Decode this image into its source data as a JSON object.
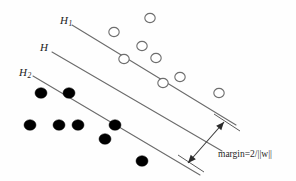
{
  "figure": {
    "background_color": "#fefefe",
    "width": 296,
    "height": 181
  },
  "labels": {
    "h1": {
      "base": "H",
      "subscript": "1",
      "x": 60,
      "y": 21
    },
    "h": {
      "base": "H",
      "subscript": "",
      "x": 40,
      "y": 48
    },
    "h2": {
      "base": "H",
      "subscript": "2",
      "x": 19,
      "y": 73
    }
  },
  "margin_annotation": {
    "caption": "margin=2/||w||",
    "caption_x": 218,
    "caption_y": 155,
    "color": "#1f1f1f"
  },
  "lines": {
    "stroke_color": "#6b6b6b",
    "stroke_width": 1.1,
    "items": [
      {
        "name": "H1",
        "x1": 72,
        "y1": 25,
        "x2": 236,
        "y2": 125
      },
      {
        "name": "H",
        "x1": 52,
        "y1": 52,
        "x2": 222,
        "y2": 151
      },
      {
        "name": "H2",
        "x1": 33,
        "y1": 76,
        "x2": 200,
        "y2": 175
      }
    ]
  },
  "margin_arrow": {
    "x1": 224,
    "y1": 122,
    "x2": 188,
    "y2": 163,
    "color": "#3a3a3a",
    "double_headed": true
  },
  "ticks": [
    {
      "name": "tick-upper",
      "x1": 214,
      "y1": 114,
      "x2": 240,
      "y2": 131
    },
    {
      "name": "tick-lower",
      "x1": 178,
      "y1": 155,
      "x2": 204,
      "y2": 172
    }
  ],
  "chart_data": {
    "type": "scatter",
    "xlabel": "",
    "ylabel": "",
    "grid": false,
    "legend": "none",
    "annotations": [
      "H",
      "H1",
      "H2",
      "margin=2/||w||"
    ],
    "series": [
      {
        "name": "class-positive-open-circles",
        "marker": "open-circle",
        "fill": "#ffffff",
        "stroke": "#6e6e6e",
        "radius": 5.2,
        "points": [
          {
            "x": 150,
            "y": 18
          },
          {
            "x": 114,
            "y": 32
          },
          {
            "x": 142,
            "y": 46
          },
          {
            "x": 124,
            "y": 59
          },
          {
            "x": 156,
            "y": 58
          },
          {
            "x": 180,
            "y": 77
          },
          {
            "x": 163,
            "y": 83
          },
          {
            "x": 219,
            "y": 93
          }
        ]
      },
      {
        "name": "class-negative-filled-dots",
        "marker": "filled-circle",
        "fill": "#000000",
        "stroke": "#000000",
        "radius": 6.0,
        "points": [
          {
            "x": 41,
            "y": 93
          },
          {
            "x": 69,
            "y": 93
          },
          {
            "x": 30,
            "y": 125
          },
          {
            "x": 59,
            "y": 125
          },
          {
            "x": 78,
            "y": 125
          },
          {
            "x": 115,
            "y": 125
          },
          {
            "x": 105,
            "y": 139
          },
          {
            "x": 142,
            "y": 161
          }
        ]
      }
    ]
  }
}
